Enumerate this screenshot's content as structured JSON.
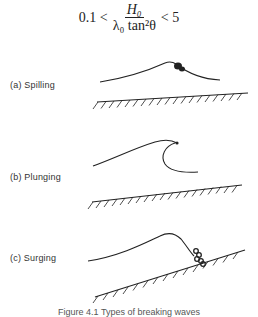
{
  "formula": {
    "left": "0.1 <",
    "numerator": "H₀",
    "denominator": "λ₀ tan²θ",
    "right": "< 5"
  },
  "panels": [
    {
      "id": "a",
      "label": "(a)  Spilling"
    },
    {
      "id": "b",
      "label": "(b)  Plunging"
    },
    {
      "id": "c",
      "label": "(c)  Surging"
    }
  ],
  "caption": "Figure 4.1   Types of breaking waves"
}
